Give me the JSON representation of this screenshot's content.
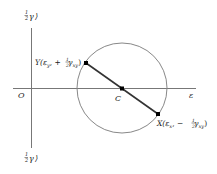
{
  "diagram": {
    "axes": {
      "horizontal_label": "ε",
      "vertical_top_label": "½γ ↻",
      "vertical_top_label_parts": {
        "frac": "1",
        "den": "2",
        "sym": "γ",
        "arrow": "⟩"
      },
      "vertical_bottom_label_parts": {
        "frac": "1",
        "den": "2",
        "sym": "γ",
        "arrow": "⟩"
      },
      "origin_label": "O"
    },
    "center_label": "C",
    "points": {
      "Y": {
        "name": "Y",
        "text": "Y(ε",
        "sub1": "y",
        "mid": ", + ",
        "frac_num": "1",
        "frac_den": "2",
        "gamma": " γ",
        "sub2": "xy",
        "close": ")"
      },
      "X": {
        "name": "X",
        "text": "X(ε",
        "sub1": "x",
        "mid": ", − ",
        "frac_num": "1",
        "frac_den": "2",
        "gamma": " γ",
        "sub2": "xy",
        "close": ")"
      }
    },
    "colors": {
      "axis": "#777777",
      "circle": "#888888",
      "diameter": "#333333",
      "point": "#000000",
      "text": "#222222"
    }
  }
}
